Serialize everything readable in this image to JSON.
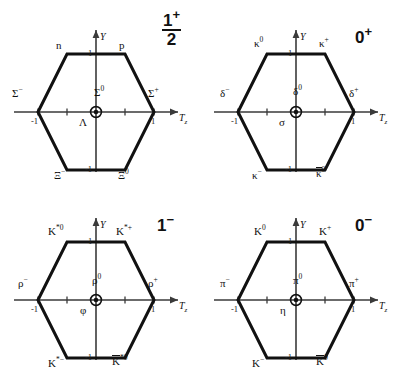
{
  "figure": {
    "axes": {
      "x_label": "T",
      "x_sub": "z",
      "y_label": "Y",
      "tick_x_neg": "-1",
      "tick_x_pos": "1",
      "tick_y_pos": "1",
      "tick_y_neg": "-1"
    },
    "colors": {
      "hexagon_stroke": "#111111",
      "axis_stroke": "#3a3a3a",
      "center_marker": "#111111",
      "background": "#ffffff"
    }
  },
  "panels": [
    {
      "id": "baryon-octet",
      "quantum_numbers": {
        "spin": "1",
        "denominator": "2",
        "parity": "+",
        "is_fraction": true
      },
      "states": {
        "top_left": {
          "base": "n",
          "sup": "",
          "overline": false
        },
        "top_right": {
          "base": "p",
          "sup": "",
          "overline": false
        },
        "mid_left": {
          "base": "Σ",
          "sup": "−",
          "overline": false
        },
        "mid_right": {
          "base": "Σ",
          "sup": "+",
          "overline": false
        },
        "center_upper": {
          "base": "Σ",
          "sup": "0",
          "overline": false
        },
        "center_lower": {
          "base": "Λ",
          "sup": "",
          "overline": false
        },
        "bottom_left": {
          "base": "Ξ",
          "sup": "−",
          "overline": false
        },
        "bottom_right": {
          "base": "Ξ",
          "sup": "0",
          "overline": false
        }
      }
    },
    {
      "id": "scalar-nonet",
      "quantum_numbers": {
        "spin": "0",
        "denominator": "",
        "parity": "+",
        "is_fraction": false
      },
      "states": {
        "top_left": {
          "base": "κ",
          "sup": "0",
          "overline": false
        },
        "top_right": {
          "base": "κ",
          "sup": "+",
          "overline": false
        },
        "mid_left": {
          "base": "δ",
          "sup": "−",
          "overline": false
        },
        "mid_right": {
          "base": "δ",
          "sup": "+",
          "overline": false
        },
        "center_upper": {
          "base": "δ",
          "sup": "0",
          "overline": false
        },
        "center_lower": {
          "base": "σ",
          "sup": "",
          "overline": false
        },
        "bottom_left": {
          "base": "κ",
          "sup": "−",
          "overline": false
        },
        "bottom_right": {
          "base": "κ",
          "sup": "0",
          "overline": true
        }
      }
    },
    {
      "id": "vector-nonet",
      "quantum_numbers": {
        "spin": "1",
        "denominator": "",
        "parity": "−",
        "is_fraction": false
      },
      "states": {
        "top_left": {
          "base": "K",
          "sup": "*0",
          "overline": false
        },
        "top_right": {
          "base": "K",
          "sup": "*+",
          "overline": false
        },
        "mid_left": {
          "base": "ρ",
          "sup": "−",
          "overline": false
        },
        "mid_right": {
          "base": "ρ",
          "sup": "+",
          "overline": false
        },
        "center_upper": {
          "base": "ρ",
          "sup": "0",
          "overline": false
        },
        "center_lower": {
          "base": "φ",
          "sup": "",
          "overline": false
        },
        "bottom_left": {
          "base": "K",
          "sup": "*−",
          "overline": false
        },
        "bottom_right": {
          "base": "K",
          "sup": "*0",
          "overline": true
        }
      }
    },
    {
      "id": "pseudoscalar-nonet",
      "quantum_numbers": {
        "spin": "0",
        "denominator": "",
        "parity": "−",
        "is_fraction": false
      },
      "states": {
        "top_left": {
          "base": "K",
          "sup": "0",
          "overline": false
        },
        "top_right": {
          "base": "K",
          "sup": "+",
          "overline": false
        },
        "mid_left": {
          "base": "π",
          "sup": "−",
          "overline": false
        },
        "mid_right": {
          "base": "π",
          "sup": "+",
          "overline": false
        },
        "center_upper": {
          "base": "π",
          "sup": "0",
          "overline": false
        },
        "center_lower": {
          "base": "η",
          "sup": "",
          "overline": false
        },
        "bottom_left": {
          "base": "K",
          "sup": "−",
          "overline": false
        },
        "bottom_right": {
          "base": "K",
          "sup": "0",
          "overline": true
        }
      }
    }
  ]
}
